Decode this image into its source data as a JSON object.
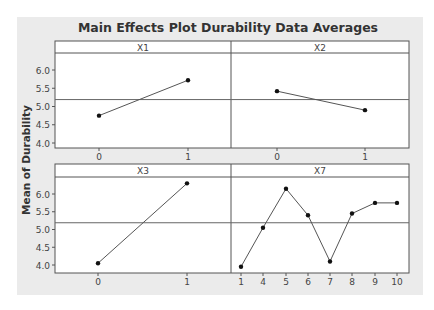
{
  "chart_data": {
    "type": "line",
    "title": "Main Effects Plot Durability Data Averages",
    "ylabel": "Mean of Durability",
    "xlabel": "",
    "ylim": [
      3.85,
      6.45
    ],
    "yticks": [
      4.0,
      4.5,
      5.0,
      5.5,
      6.0
    ],
    "ytick_labels": [
      "4.0",
      "4.5",
      "5.0",
      "5.5",
      "6.0"
    ],
    "grand_mean": 5.19,
    "grid": false,
    "legend": null,
    "panels": [
      {
        "factor": "X1",
        "categories": [
          "0",
          "1"
        ],
        "values": [
          4.75,
          5.72
        ]
      },
      {
        "factor": "X2",
        "categories": [
          "0",
          "1"
        ],
        "values": [
          5.42,
          4.9
        ]
      },
      {
        "factor": "X3",
        "categories": [
          "0",
          "1"
        ],
        "values": [
          4.05,
          6.3
        ]
      },
      {
        "factor": "X7",
        "categories": [
          "1",
          "4",
          "5",
          "6",
          "7",
          "8",
          "9",
          "10"
        ],
        "values": [
          3.95,
          5.05,
          6.15,
          5.4,
          4.1,
          5.45,
          5.75,
          5.75
        ]
      }
    ]
  },
  "colors": {
    "frame_bg": "#ebebeb",
    "panel_bg": "#ffffff",
    "line": "#555555",
    "marker": "#111111",
    "border": "#555555",
    "text": "#333333"
  }
}
